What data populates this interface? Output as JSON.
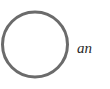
{
  "diagram": {
    "shape": {
      "type": "circle",
      "stroke_color": "#6b6b6b",
      "fill": "none"
    },
    "label": {
      "text": "an"
    }
  }
}
